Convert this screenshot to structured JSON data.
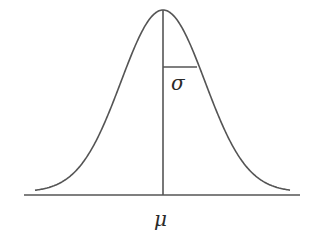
{
  "diagram": {
    "type": "normal-distribution",
    "labels": {
      "mean": "μ",
      "std_dev": "σ"
    },
    "colors": {
      "stroke": "#555555",
      "text": "#2a2a2a",
      "background": "#ffffff"
    }
  }
}
